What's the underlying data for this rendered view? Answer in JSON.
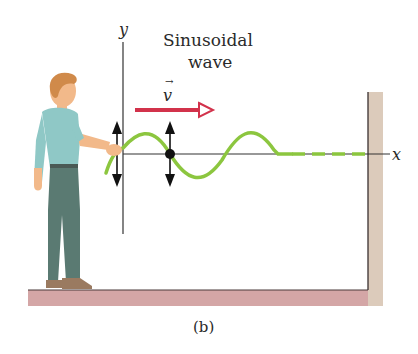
{
  "figure": {
    "title_line1": "Sinusoidal",
    "title_line2": "wave",
    "y_axis_label": "y",
    "x_axis_label": "x",
    "velocity_label": "v",
    "velocity_vector_mark": "→",
    "caption": "(b)"
  },
  "elements": {
    "person": "man holding rope end, moving hand up and down",
    "wave": "sinusoidal wave traveling along a rope toward a wall",
    "rope_ahead": "dashed undisturbed rope segment",
    "wall": "fixed wall at right end",
    "floor": "ground floor",
    "particle": "black dot on rope with vertical double-headed arrow",
    "hand_motion": "vertical double-headed arrow at hand"
  },
  "colors": {
    "wave": "#8cc63f",
    "velocity_arrow": "#d2324b",
    "wall": "#d9c7b5",
    "floor": "#d4a6a6",
    "axis": "#333333",
    "shirt": "#8fc8c6",
    "pants": "#5a7a72",
    "skin": "#f2b98a",
    "hair": "#d08a4a"
  }
}
